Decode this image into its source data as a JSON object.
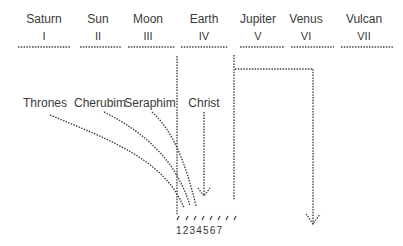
{
  "columns": [
    {
      "name": "Saturn",
      "numeral": "I",
      "x": 44
    },
    {
      "name": "Sun",
      "numeral": "II",
      "x": 98
    },
    {
      "name": "Moon",
      "numeral": "III",
      "x": 148
    },
    {
      "name": "Earth",
      "numeral": "IV",
      "x": 204
    },
    {
      "name": "Jupiter",
      "numeral": "V",
      "x": 258
    },
    {
      "name": "Venus",
      "numeral": "VI",
      "x": 306
    },
    {
      "name": "Vulcan",
      "numeral": "VII",
      "x": 364
    }
  ],
  "beings": [
    {
      "name": "Thrones",
      "x": 45
    },
    {
      "name": "Cherubim",
      "x": 100
    },
    {
      "name": "Seraphim",
      "x": 150
    },
    {
      "name": "Christ",
      "x": 204
    }
  ],
  "bottom_numbers": "1234567",
  "line_color": "#444444"
}
